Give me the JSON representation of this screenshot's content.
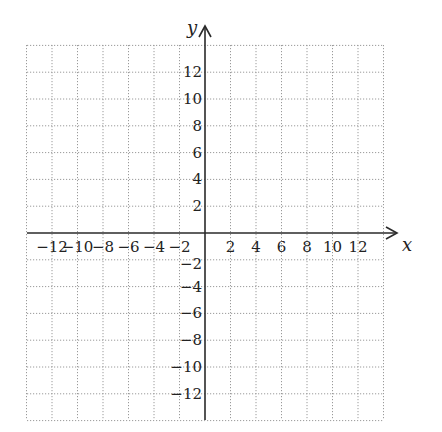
{
  "chart_data": {
    "type": "scatter",
    "title": "",
    "xlabel": "x",
    "ylabel": "y",
    "xlim": [
      -14,
      14
    ],
    "ylim": [
      -14,
      14
    ],
    "grid": true,
    "grid_step": 2,
    "grid_style": "dotted",
    "x_ticks": [
      -12,
      -10,
      -8,
      -6,
      -4,
      -2,
      2,
      4,
      6,
      8,
      10,
      12
    ],
    "y_ticks": [
      12,
      10,
      8,
      6,
      4,
      2,
      -2,
      -4,
      -6,
      -8,
      -10,
      -12
    ],
    "x_tick_labels": [
      "−12",
      "−10",
      "−8",
      "−6",
      "−4",
      "−2",
      "2",
      "4",
      "6",
      "8",
      "10",
      "12"
    ],
    "y_tick_labels": [
      "12",
      "10",
      "8",
      "6",
      "4",
      "2",
      "−2",
      "−4",
      "−6",
      "−8",
      "−10",
      "−12"
    ],
    "series": [],
    "legend": null
  },
  "layout": {
    "origin_px": [
      205,
      233
    ],
    "unit_px_x": 12.75,
    "unit_px_y": 13.4,
    "grid_left": 27,
    "grid_right": 384,
    "grid_top": 45,
    "grid_bottom": 420,
    "x_axis_start": 27,
    "x_axis_end": 397,
    "y_axis_top": 26,
    "y_axis_bottom": 420
  },
  "labels": {
    "x_axis": "x",
    "y_axis": "y"
  },
  "colors": {
    "grid": "#9a9a9a",
    "axis": "#2a2a2a",
    "text": "#222222"
  }
}
